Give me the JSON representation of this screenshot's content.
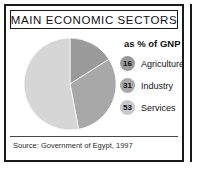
{
  "panel": {
    "title": "MAIN ECONOMIC SECTORS",
    "source": "Source: Government of Egypt, 1997"
  },
  "legend": {
    "heading": "as % of GNP",
    "items": [
      {
        "value": "16",
        "label": "Agriculture",
        "color": "#9a9a9a"
      },
      {
        "value": "31",
        "label": "Industry",
        "color": "#a8a8a8"
      },
      {
        "value": "53",
        "label": "Services",
        "color": "#c9c9c9"
      }
    ]
  },
  "chart_data": {
    "type": "pie",
    "title": "MAIN ECONOMIC SECTORS",
    "subtitle": "as % of GNP",
    "unit": "% of GNP",
    "categories": [
      "Agriculture",
      "Industry",
      "Services"
    ],
    "values": [
      16,
      31,
      53
    ],
    "colors": [
      "#9a9a9a",
      "#a8a8a8",
      "#d6d6d6"
    ],
    "legend_position": "right",
    "grid": false,
    "source": "Source: Government of Egypt, 1997",
    "slices": [
      {
        "name": "Agriculture",
        "value": 16,
        "start_deg": 0,
        "end_deg": 57.6,
        "color": "#9a9a9a"
      },
      {
        "name": "Industry",
        "value": 31,
        "start_deg": 57.6,
        "end_deg": 169.2,
        "color": "#a8a8a8"
      },
      {
        "name": "Services",
        "value": 53,
        "start_deg": 169.2,
        "end_deg": 360,
        "color": "#d6d6d6"
      }
    ]
  }
}
